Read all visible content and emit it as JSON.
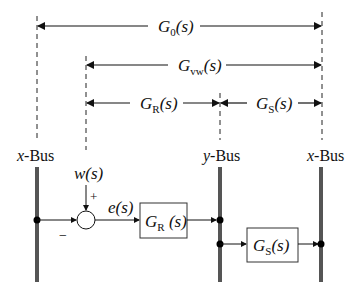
{
  "spans": {
    "g0": {
      "main": "G",
      "sub": "0",
      "arg": "(s)"
    },
    "gvw": {
      "main": "G",
      "sub": "vw",
      "arg": "(s)"
    },
    "gr": {
      "main": "G",
      "sub": "R",
      "arg": "(s)"
    },
    "gs": {
      "main": "G",
      "sub": "S",
      "arg": "(s)"
    }
  },
  "buses": {
    "left": {
      "var": "x",
      "suffix": "-Bus"
    },
    "middle": {
      "var": "y",
      "suffix": "-Bus"
    },
    "right": {
      "var": "x",
      "suffix": "-Bus"
    }
  },
  "signals": {
    "input": {
      "main": "w",
      "arg": "(s)"
    },
    "error": {
      "main": "e",
      "arg": "(s)"
    },
    "plus_sign": "+",
    "minus_sign": "−"
  },
  "blocks": {
    "gr": {
      "main": "G",
      "sub": "R",
      "arg": " (s)"
    },
    "gs": {
      "main": "G",
      "sub": "S",
      "arg": "(s)"
    }
  },
  "colors": {
    "bus": "#555555",
    "line": "#111111",
    "dashed": "#222222"
  }
}
